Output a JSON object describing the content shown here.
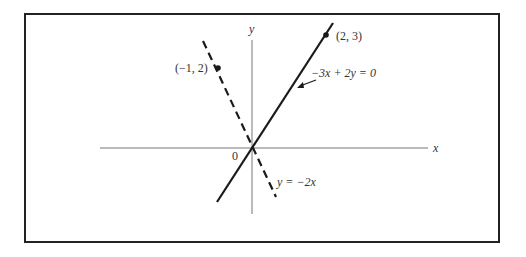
{
  "figure": {
    "axes": {
      "x_label": "x",
      "y_label": "y",
      "origin_label": "0"
    },
    "lines": [
      {
        "name": "solid-line",
        "style": "solid",
        "equation_label": "−3x + 2y = 0",
        "point_label": "(2, 3)"
      },
      {
        "name": "dashed-line",
        "style": "dashed",
        "equation_label": "y = −2x",
        "point_label": "(−1, 2)"
      }
    ],
    "colors": {
      "ink": "#1a1a1a",
      "axis": "#777777",
      "border": "#222222",
      "background": "#ffffff"
    }
  }
}
